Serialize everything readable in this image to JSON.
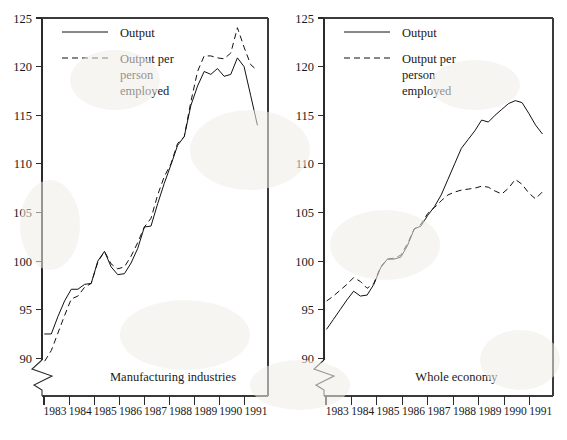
{
  "figure": {
    "background_color": "#ffffff",
    "ink_color": "#111111"
  },
  "chart_data": [
    {
      "type": "line",
      "title": "Manufacturing industries",
      "panel": "left",
      "xlabel": "",
      "ylabel": "",
      "xlim": [
        1982.5,
        1991.0
      ],
      "ylim": [
        88,
        125
      ],
      "yticks": [
        90,
        95,
        100,
        105,
        110,
        115,
        120,
        125
      ],
      "ytick_labels": [
        "90",
        "95",
        "100",
        "105",
        "110",
        "115",
        "120",
        "125"
      ],
      "xticks": [
        1983,
        1984,
        1985,
        1986,
        1987,
        1988,
        1989,
        1990,
        1991
      ],
      "xtick_labels": [
        "1983",
        "1984",
        "1985",
        "1986",
        "1987",
        "1988",
        "1989",
        "1990",
        "1991"
      ],
      "axis_break": true,
      "grid": false,
      "legend_position": "top-left",
      "x": [
        1982.6,
        1982.85,
        1983.1,
        1983.35,
        1983.6,
        1983.85,
        1984.1,
        1984.35,
        1984.6,
        1984.85,
        1985.1,
        1985.35,
        1985.6,
        1985.85,
        1986.1,
        1986.35,
        1986.6,
        1986.85,
        1987.1,
        1987.35,
        1987.6,
        1987.85,
        1988.1,
        1988.35,
        1988.6,
        1988.85,
        1989.1,
        1989.35,
        1989.6,
        1989.85,
        1990.1,
        1990.35,
        1990.6
      ],
      "series": [
        {
          "name": "Output",
          "style": "solid",
          "values": [
            92.5,
            92.5,
            94.3,
            95.9,
            97.1,
            97.1,
            97.6,
            97.7,
            100.0,
            101.0,
            99.4,
            98.6,
            98.7,
            99.8,
            101.3,
            103.5,
            103.6,
            105.9,
            108.0,
            109.9,
            111.9,
            112.8,
            116.0,
            118.0,
            119.5,
            119.2,
            119.8,
            119.0,
            119.2,
            120.9,
            120.0,
            117.0,
            114.0
          ]
        },
        {
          "name": "Output per person employed",
          "style": "dashed",
          "values": [
            89.7,
            90.8,
            92.6,
            94.4,
            96.1,
            96.4,
            97.3,
            97.7,
            99.9,
            101.0,
            99.7,
            99.2,
            99.4,
            100.5,
            101.9,
            103.5,
            104.4,
            106.8,
            108.7,
            110.0,
            112.1,
            112.8,
            116.4,
            119.5,
            121.1,
            121.1,
            120.9,
            120.8,
            121.4,
            124.0,
            122.0,
            120.2,
            119.6
          ]
        }
      ]
    },
    {
      "type": "line",
      "title": "Whole economy",
      "panel": "right",
      "xlabel": "",
      "ylabel": "",
      "xlim": [
        1982.5,
        1991.0
      ],
      "ylim": [
        88,
        125
      ],
      "yticks": [
        90,
        95,
        100,
        105,
        110,
        115,
        120,
        125
      ],
      "ytick_labels": [
        "90",
        "95",
        "100",
        "105",
        "110",
        "115",
        "120",
        "125"
      ],
      "xticks": [
        1983,
        1984,
        1985,
        1986,
        1987,
        1988,
        1989,
        1990,
        1991
      ],
      "xtick_labels": [
        "1983",
        "1984",
        "1985",
        "1986",
        "1987",
        "1988",
        "1989",
        "1990",
        "1991"
      ],
      "axis_break": true,
      "grid": false,
      "legend_position": "top-left",
      "x": [
        1982.6,
        1982.85,
        1983.1,
        1983.35,
        1983.6,
        1983.85,
        1984.1,
        1984.35,
        1984.6,
        1984.85,
        1985.1,
        1985.35,
        1985.6,
        1985.85,
        1986.1,
        1986.35,
        1986.6,
        1986.85,
        1987.1,
        1987.35,
        1987.6,
        1987.85,
        1988.1,
        1988.35,
        1988.6,
        1988.85,
        1989.1,
        1989.35,
        1989.6,
        1989.85,
        1990.1,
        1990.35,
        1990.6
      ],
      "series": [
        {
          "name": "Output",
          "style": "solid",
          "values": [
            93.0,
            94.0,
            95.0,
            96.0,
            96.9,
            96.4,
            96.5,
            97.6,
            99.3,
            100.2,
            100.2,
            100.4,
            101.6,
            103.3,
            103.6,
            104.7,
            105.6,
            106.8,
            108.4,
            110.0,
            111.6,
            112.5,
            113.4,
            114.5,
            114.3,
            115.0,
            115.6,
            116.2,
            116.5,
            116.3,
            115.2,
            114.0,
            113.1
          ]
        },
        {
          "name": "Output per person employed",
          "style": "dashed",
          "values": [
            95.9,
            96.4,
            97.0,
            97.6,
            98.3,
            97.9,
            97.2,
            97.7,
            99.4,
            100.2,
            100.3,
            100.6,
            101.8,
            103.3,
            103.8,
            104.9,
            105.5,
            106.2,
            106.8,
            107.1,
            107.3,
            107.4,
            107.5,
            107.7,
            107.6,
            107.2,
            106.9,
            107.5,
            108.4,
            107.9,
            107.0,
            106.4,
            107.1
          ]
        }
      ]
    }
  ],
  "legend": {
    "entries": [
      {
        "label": "Output",
        "style": "solid"
      },
      {
        "label": "Output per person employed",
        "style": "dashed",
        "lines": [
          "Output per",
          "person",
          "employed"
        ]
      }
    ]
  }
}
